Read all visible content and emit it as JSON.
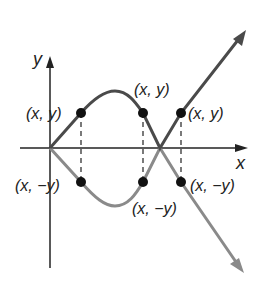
{
  "diagram": {
    "axes": {
      "x_label": "x",
      "y_label": "y"
    },
    "colors": {
      "upper_curve": "#4a4a4a",
      "lower_curve": "#8a8a8a",
      "axis": "#222222",
      "point": "#111111"
    },
    "points": {
      "upper_left": "(x, y)",
      "upper_middle": "(x, y)",
      "upper_right": "(x, y)",
      "lower_left": "(x, −y)",
      "lower_middle": "(x, −y)",
      "lower_right": "(x, −y)"
    }
  }
}
